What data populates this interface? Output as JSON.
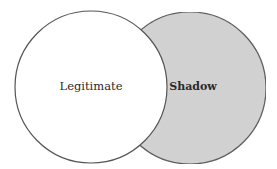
{
  "diagram": {
    "type": "venn",
    "sets": [
      {
        "id": "legitimate",
        "label": "Legitimate",
        "fill": "#ffffff",
        "stroke": "#555555",
        "cx": 91,
        "cy": 87,
        "r": 76
      },
      {
        "id": "shadow",
        "label": "Shadow",
        "fill": "#d3d3d3",
        "stroke": "#555555",
        "cx": 190,
        "cy": 88,
        "r": 76
      }
    ]
  }
}
